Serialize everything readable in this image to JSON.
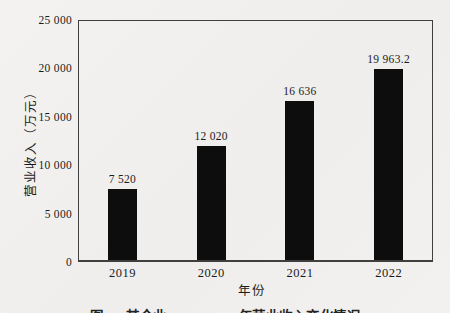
{
  "page": {
    "background": "#f2f1ef",
    "text_color": "#1b1b1b"
  },
  "chart_data": {
    "type": "bar",
    "title": "",
    "categories": [
      "2019",
      "2020",
      "2021",
      "2022"
    ],
    "values": [
      7520,
      12020,
      16636,
      19963.2
    ],
    "value_labels": [
      "7 520",
      "12 020",
      "16 636",
      "19 963.2"
    ],
    "xlabel": "年份",
    "ylabel": "营业收入（万元）",
    "ylim": [
      0,
      25000
    ],
    "y_ticks": [
      {
        "value": 0,
        "label": "0"
      },
      {
        "value": 5000,
        "label": "5 000"
      },
      {
        "value": 10000,
        "label": "10 000"
      },
      {
        "value": 15000,
        "label": "15 000"
      },
      {
        "value": 20000,
        "label": "20 000"
      },
      {
        "value": 25000,
        "label": "25 000"
      }
    ],
    "bar_color": "#0d0d0d",
    "grid": false,
    "legend_position": "none"
  },
  "caption": {
    "text": "图1-2 某企业2019—2022年营业收入变化情况"
  }
}
